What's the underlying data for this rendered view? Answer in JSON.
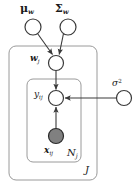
{
  "figure": {
    "type": "plate-diagram",
    "background_color": "#ffffff",
    "stroke_color": "#3a3a3a",
    "plate_stroke_color": "#9a9a9a",
    "observed_fill_color": "#808080",
    "latent_fill_color": "#ffffff"
  },
  "nodes": {
    "mu_w": {
      "label_main": "μ",
      "label_sub": "w",
      "cx": 33,
      "cy": 27,
      "r": 8,
      "shaded": false
    },
    "sigma_w": {
      "label_main": "Σ",
      "label_sub": "w",
      "cx": 68,
      "cy": 27,
      "r": 8,
      "shaded": false
    },
    "w_j": {
      "label_main": "w",
      "label_sub": "j",
      "cx": 56,
      "cy": 63,
      "r": 7.5,
      "shaded": false
    },
    "y_ij": {
      "label_main": "y",
      "label_sub": "ij",
      "cx": 56,
      "cy": 98,
      "r": 7.5,
      "shaded": false
    },
    "x_ij": {
      "label_main": "x",
      "label_sub": "ij",
      "cx": 56,
      "cy": 136,
      "r": 7.5,
      "shaded": true
    },
    "sigma_sq": {
      "label_main": "σ",
      "label_sup": "2",
      "cx": 124,
      "cy": 98,
      "r": 7.5,
      "shaded": false
    }
  },
  "plates": {
    "outer": {
      "label": "J",
      "x": 9,
      "y": 46,
      "width": 88,
      "height": 134,
      "radius": 7
    },
    "inner": {
      "label": "N",
      "label_sub": "j",
      "x": 27,
      "y": 79,
      "width": 54,
      "height": 83,
      "radius": 6
    }
  },
  "edges": [
    {
      "from": "mu_w",
      "to": "w_j",
      "kind": "directed"
    },
    {
      "from": "sigma_w",
      "to": "w_j",
      "kind": "directed"
    },
    {
      "from": "w_j",
      "to": "y_ij",
      "kind": "directed"
    },
    {
      "from": "x_ij",
      "to": "y_ij",
      "kind": "directed"
    },
    {
      "from": "sigma_sq",
      "to": "y_ij",
      "kind": "directed"
    }
  ],
  "labels": {
    "mu_w_text": "μ",
    "mu_w_sub": "w",
    "sigma_w_text": "Σ",
    "sigma_w_sub": "w",
    "w_text": "w",
    "w_sub": "j",
    "y_text": "y",
    "y_sub": "ij",
    "x_text": "x",
    "x_sub": "ij",
    "sigma_sq_text": "σ",
    "sigma_sq_sup": "2",
    "inner_plate_text": "N",
    "inner_plate_sub": "j",
    "outer_plate_text": "J"
  }
}
